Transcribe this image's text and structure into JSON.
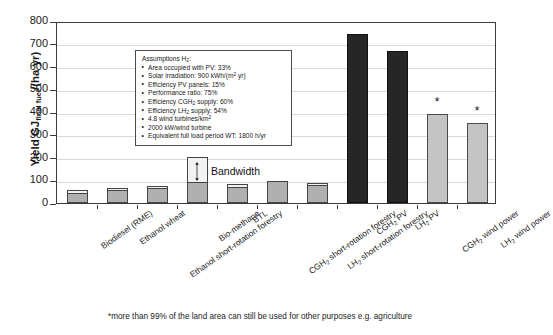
{
  "chart_data": {
    "type": "bar",
    "title": "",
    "xlabel": "",
    "ylabel": "Yield GJfinal fuel/(ha yr)",
    "ylabel_main": "Yield GJ",
    "ylabel_sub": "final fuel",
    "ylabel_tail": "/(ha yr)",
    "ylim": [
      0,
      800
    ],
    "ytick_step": 100,
    "yticks": [
      "800",
      "700",
      "600",
      "500",
      "400",
      "300",
      "200",
      "100",
      "0"
    ],
    "grid": true,
    "legend_position": "none",
    "categories": [
      "Biodiesel (RME)",
      "Ethanol wheat",
      "Ethanol short-rotation forestry",
      "Bio-methane",
      "BTL",
      "CGH2 short-rotation forestry",
      "LH2 short-rotation forestry",
      "CGH2 PV",
      "LH2 PV",
      "CGH2 wind power",
      "LH2 wind power"
    ],
    "values": [
      55,
      65,
      72,
      200,
      80,
      95,
      85,
      740,
      665,
      390,
      350
    ],
    "bandwidth_low": [
      40,
      55,
      62,
      90,
      70,
      95,
      78,
      null,
      null,
      null,
      null
    ],
    "series": [
      {
        "name": "Yield",
        "values": [
          55,
          65,
          72,
          200,
          80,
          95,
          85,
          740,
          665,
          390,
          350
        ]
      }
    ],
    "annotations": [
      {
        "text": "Bandwidth",
        "target": "Bio-methane"
      },
      {
        "text": "*",
        "target": "CGH2 wind power"
      },
      {
        "text": "*",
        "target": "LH2 wind power"
      }
    ]
  },
  "xlabels": [
    {
      "main": "Biodiesel (RME)",
      "pre": "Biodiesel (RME)",
      "sub": "",
      "post": ""
    },
    {
      "main": "Ethanol wheat",
      "pre": "Ethanol wheat",
      "sub": "",
      "post": ""
    },
    {
      "main": "Ethanol short-rotation forestry",
      "pre": "Ethanol short-rotation forestry",
      "sub": "",
      "post": ""
    },
    {
      "main": "Bio-methane",
      "pre": "Bio-methane",
      "sub": "",
      "post": ""
    },
    {
      "main": "BTL",
      "pre": "BTL",
      "sub": "",
      "post": ""
    },
    {
      "main": "CGH2 short-rotation forestry",
      "pre": "CGH",
      "sub": "2",
      "post": " short-rotation forestry"
    },
    {
      "main": "LH2 short-rotation forestry",
      "pre": "LH",
      "sub": "2",
      "post": " short-rotation forestry"
    },
    {
      "main": "CGH2 PV",
      "pre": "CGH",
      "sub": "2",
      "post": " PV"
    },
    {
      "main": "LH2 PV",
      "pre": "LH",
      "sub": "2",
      "post": " PV"
    },
    {
      "main": "CGH2 wind power",
      "pre": "CGH",
      "sub": "2",
      "post": " wind power"
    },
    {
      "main": "LH2 wind power",
      "pre": "LH",
      "sub": "2",
      "post": " wind power"
    }
  ],
  "assumptions": {
    "header_pre": "Assumptions H",
    "header_sub": "2",
    "header_post": ":",
    "items": [
      {
        "pre": "Area occupied with PV: 33%",
        "sub": "",
        "post": "",
        "sup": ""
      },
      {
        "pre": "Solar irradiation: 900 kWh/(m",
        "sub": "",
        "sup": "2",
        "post": " yr)"
      },
      {
        "pre": "Efficiency PV panels: 15%",
        "sub": "",
        "post": "",
        "sup": ""
      },
      {
        "pre": "Performance ratio: 75%",
        "sub": "",
        "post": "",
        "sup": ""
      },
      {
        "pre": "Efficiency CGH",
        "sub": "2",
        "post": " supply: 60%",
        "sup": ""
      },
      {
        "pre": "Efficiency LH",
        "sub": "2",
        "post": " supply: 54%",
        "sup": ""
      },
      {
        "pre": "4.8 wind turbines/km",
        "sub": "",
        "sup": "2",
        "post": ""
      },
      {
        "pre": "2000 kW/wind turbine",
        "sub": "",
        "post": "",
        "sup": ""
      },
      {
        "pre": "Equivalent full load period WT: 1800 h/yr",
        "sub": "",
        "post": "",
        "sup": ""
      }
    ]
  },
  "bandwidth_label": "Bandwidth",
  "footnote": "*more than 99% of the land area can still be used for other purposes e.g. agriculture",
  "colors": {
    "bar_gray": "#b0b0b0",
    "bar_black": "#262626",
    "bar_light": "#c4c4c4",
    "grid": "#d8d8d8",
    "axis": "#3c3c3c",
    "text": "#1a1a1a"
  }
}
